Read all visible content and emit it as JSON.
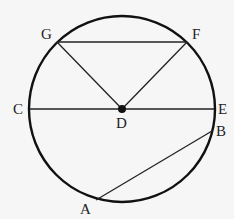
{
  "diagram": {
    "type": "circle-geometry",
    "colors": {
      "background": "#f6f6f6",
      "stroke": "#111111"
    },
    "circle": {
      "cx": 122,
      "cy": 109,
      "r": 93
    },
    "center": {
      "name": "D",
      "x": 122,
      "y": 109
    },
    "points": [
      {
        "name": "G",
        "x": 57,
        "y": 42,
        "label": "G",
        "lx": 41,
        "ly": 39
      },
      {
        "name": "F",
        "x": 187,
        "y": 42,
        "label": "F",
        "lx": 192,
        "ly": 39
      },
      {
        "name": "C",
        "x": 30,
        "y": 109,
        "label": "C",
        "lx": 13,
        "ly": 114
      },
      {
        "name": "E",
        "x": 214,
        "y": 109,
        "label": "E",
        "lx": 218,
        "ly": 114
      },
      {
        "name": "D",
        "x": 122,
        "y": 109,
        "label": "D",
        "lx": 116,
        "ly": 128
      },
      {
        "name": "B",
        "x": 212,
        "y": 131,
        "label": "B",
        "lx": 216,
        "ly": 136
      },
      {
        "name": "A",
        "x": 96,
        "y": 200,
        "label": "A",
        "lx": 80,
        "ly": 214
      }
    ],
    "segments": [
      {
        "from": "G",
        "to": "F"
      },
      {
        "from": "G",
        "to": "D"
      },
      {
        "from": "F",
        "to": "D"
      },
      {
        "from": "C",
        "to": "E"
      },
      {
        "from": "A",
        "to": "B"
      }
    ]
  }
}
